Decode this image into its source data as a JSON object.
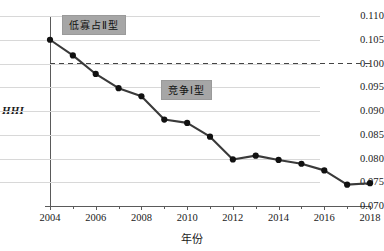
{
  "chart_data": {
    "type": "line",
    "title": "",
    "xlabel": "年份",
    "ylabel": "HHI",
    "xlim": [
      2004,
      2018
    ],
    "ylim": [
      0.07,
      0.11
    ],
    "grid": true,
    "legend": "none",
    "x": [
      2004,
      2005,
      2006,
      2007,
      2008,
      2009,
      2010,
      2011,
      2012,
      2013,
      2014,
      2015,
      2016,
      2017,
      2018
    ],
    "xtick_labels": [
      "2004",
      "2006",
      "2008",
      "2010",
      "2012",
      "2014",
      "2016",
      "2018"
    ],
    "ytick_labels": [
      "0.110",
      "0.105",
      "0.100",
      "0.095",
      "0.090",
      "0.085",
      "0.080",
      "0.075",
      "0.070"
    ],
    "ytick_values": [
      0.11,
      0.105,
      0.1,
      0.095,
      0.09,
      0.085,
      0.08,
      0.075,
      0.07
    ],
    "series": [
      {
        "name": "HHI",
        "values": [
          0.105,
          0.1017,
          0.0978,
          0.0948,
          0.0931,
          0.0882,
          0.0875,
          0.0846,
          0.0798,
          0.0806,
          0.0797,
          0.0789,
          0.0775,
          0.0745,
          0.0748
        ],
        "color": "#3a3a3a",
        "marker": "circle"
      }
    ],
    "reference_lines": [
      {
        "name": "threshold",
        "axis": "y",
        "value": 0.1,
        "style": "dashed",
        "color": "#444444"
      }
    ],
    "annotations": [
      {
        "text": "低寡占Ⅱ型",
        "x": 2005.2,
        "y": 0.1085,
        "background": "#a6a6a6"
      },
      {
        "text": "竞争Ⅰ型",
        "x": 2009.5,
        "y": 0.0945,
        "background": "#a6a6a6"
      }
    ]
  },
  "colors": {
    "line": "#3a3a3a",
    "marker": "#111111",
    "grid": "#d8d8d8",
    "axis": "#5a5a5a",
    "annotation_bg": "#a6a6a6",
    "reference_line": "#444444",
    "background": "#ffffff"
  }
}
